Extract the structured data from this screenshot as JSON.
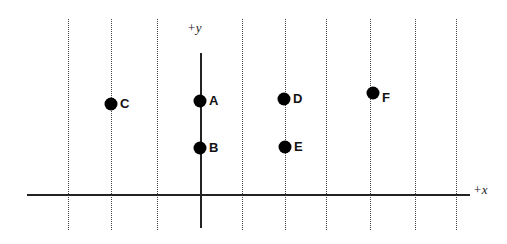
{
  "diagram": {
    "axes": {
      "x_label": "+x",
      "y_label": "+y",
      "x_axis": {
        "y": 195,
        "x_start": 27,
        "x_end": 470
      },
      "y_axis": {
        "x": 201,
        "y_start": 53,
        "y_end": 228
      }
    },
    "grid_lines_x": [
      68,
      111,
      157,
      242,
      285,
      326,
      370,
      415,
      456
    ],
    "grid_top": 19,
    "grid_bottom": 230,
    "points": [
      {
        "label": "A",
        "x": 200,
        "y": 101
      },
      {
        "label": "B",
        "x": 200,
        "y": 148
      },
      {
        "label": "C",
        "x": 111,
        "y": 104
      },
      {
        "label": "D",
        "x": 284,
        "y": 99
      },
      {
        "label": "E",
        "x": 285,
        "y": 147
      },
      {
        "label": "F",
        "x": 373,
        "y": 93
      }
    ]
  }
}
